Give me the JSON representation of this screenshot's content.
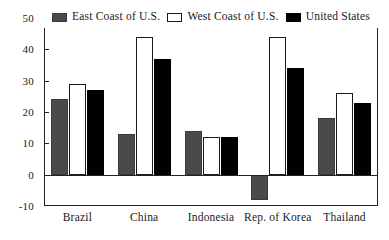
{
  "chart_data": {
    "type": "bar",
    "title": "",
    "xlabel": "",
    "ylabel": "",
    "ylim": [
      -10,
      50
    ],
    "yticks": [
      -10,
      0,
      10,
      20,
      30,
      40,
      50
    ],
    "grid": false,
    "legend_position": "top-inside",
    "categories": [
      "Brazil",
      "China",
      "Indonesia",
      "Rep. of Korea",
      "Thailand"
    ],
    "series": [
      {
        "name": "East Coast of U.S.",
        "color": "#4a4a4a",
        "values": [
          24,
          13,
          14,
          -8,
          18
        ]
      },
      {
        "name": "West Coast of U.S.",
        "color": "#ffffff",
        "values": [
          29,
          44,
          12,
          44,
          26
        ]
      },
      {
        "name": "United States",
        "color": "#000000",
        "values": [
          27,
          37,
          12,
          34,
          23
        ]
      }
    ]
  }
}
